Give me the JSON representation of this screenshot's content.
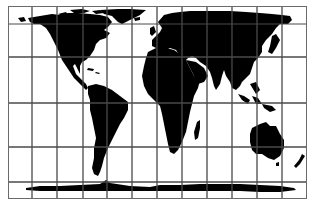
{
  "map": {
    "projection": "cylindrical equal-area (Gall-Peters style) world map",
    "colors": {
      "land": "#000000",
      "ocean": "#ffffff",
      "grid": "#4a4a4a",
      "frame": "#6a6a6a"
    },
    "frame": {
      "x": 8,
      "y": 6,
      "width": 299,
      "height": 193
    },
    "grid": {
      "meridians_x": [
        32,
        57,
        83,
        107,
        132,
        157,
        182,
        207,
        232,
        257,
        282
      ],
      "parallels_y": [
        24,
        57,
        103,
        147,
        182
      ]
    },
    "landmasses": [
      "North America",
      "Greenland",
      "South America",
      "Europe",
      "Africa",
      "Madagascar",
      "Asia",
      "Arabian Peninsula",
      "India",
      "Southeast Asia",
      "Indonesia",
      "Japan",
      "Australia",
      "Tasmania",
      "New Zealand",
      "Antarctica"
    ]
  }
}
